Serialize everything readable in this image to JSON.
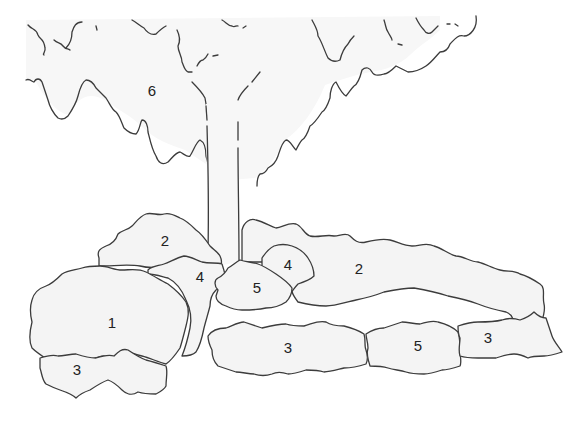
{
  "diagram": {
    "type": "planting-diagram",
    "colors": {
      "fill": "#f4f4f4",
      "outline": "#3c3c3c",
      "label": "#222222",
      "background": "#ffffff"
    },
    "tree": {
      "label": "6",
      "parts": [
        "canopy",
        "trunk"
      ]
    },
    "masses": [
      {
        "id": "mass-1-left",
        "label": "1"
      },
      {
        "id": "mass-2-upper-left",
        "label": "2"
      },
      {
        "id": "mass-2-right-long",
        "label": "2"
      },
      {
        "id": "mass-3-lower-left",
        "label": "3"
      },
      {
        "id": "mass-3-front-center",
        "label": "3"
      },
      {
        "id": "mass-3-front-right",
        "label": "3"
      },
      {
        "id": "mass-4-left-of-trunk",
        "label": "4"
      },
      {
        "id": "mass-4-right-of-trunk",
        "label": "4"
      },
      {
        "id": "mass-5-trunk-base",
        "label": "5"
      },
      {
        "id": "mass-5-front-right",
        "label": "5"
      }
    ],
    "labels": {
      "tree": "6",
      "m1": "1",
      "m2a": "2",
      "m2b": "2",
      "m3a": "3",
      "m3b": "3",
      "m3c": "3",
      "m4a": "4",
      "m4b": "4",
      "m5a": "5",
      "m5b": "5"
    }
  }
}
